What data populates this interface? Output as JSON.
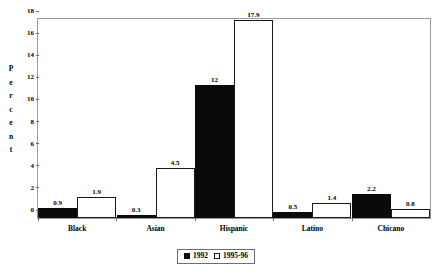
{
  "chart_data": {
    "type": "bar",
    "title": "",
    "xlabel": "",
    "ylabel": "Percent",
    "ylim": [
      0,
      18
    ],
    "yticks": [
      0,
      2,
      4,
      6,
      8,
      10,
      12,
      14,
      16,
      18
    ],
    "ytick_labels": [
      "0",
      "2",
      "4",
      "6",
      "8",
      "10",
      "12",
      "14",
      "16",
      "18"
    ],
    "grid": false,
    "legend_position": "bottom",
    "categories": [
      "Black",
      "Asian",
      "Hispanic",
      "Latino",
      "Chicano"
    ],
    "series": [
      {
        "name": "1992",
        "color": "#0a0a0a",
        "values": [
          0.9,
          0.3,
          12,
          0.5,
          2.2
        ],
        "labels": [
          "0.9",
          "0.3",
          "12",
          "0.5",
          "2.2"
        ]
      },
      {
        "name": "1995-96",
        "color": "#ffffff",
        "values": [
          1.9,
          4.5,
          17.9,
          1.4,
          0.8
        ],
        "labels": [
          "1.9",
          "4.5",
          "17.9",
          "1.4",
          "0.8"
        ]
      }
    ],
    "legend": [
      "1992",
      "1995-96"
    ]
  },
  "axis": {
    "y_title_letters": [
      "P",
      "e",
      "r",
      "c",
      "e",
      "n",
      "t"
    ]
  },
  "colors": {
    "series_1992": "#0a0a0a",
    "series_1995_96": "#ffffff",
    "frame": "#9a9a9a",
    "tick": "#6f6f6f",
    "text": "#000000",
    "background": "#ffffff"
  }
}
